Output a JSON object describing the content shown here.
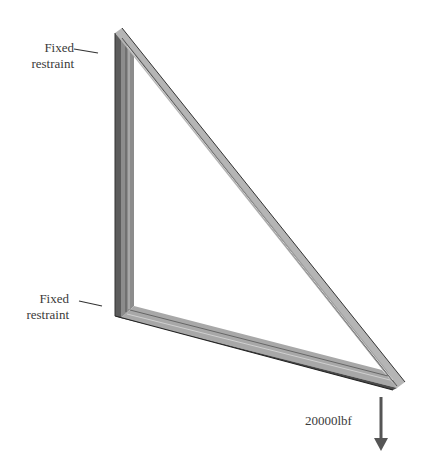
{
  "diagram": {
    "type": "truss-frame-load-case",
    "restraints": [
      {
        "line1": "Fixed",
        "line2": "restraint",
        "position": "top"
      },
      {
        "line1": "Fixed",
        "line2": "restraint",
        "position": "bottom"
      }
    ],
    "load": {
      "label": "20000lbf",
      "direction": "down"
    },
    "colors": {
      "beam_light": "#b8b8b8",
      "beam_mid": "#8a8a8a",
      "beam_dark": "#4a4a4a",
      "arrow": "#555555",
      "text": "#3a3a3a"
    }
  }
}
